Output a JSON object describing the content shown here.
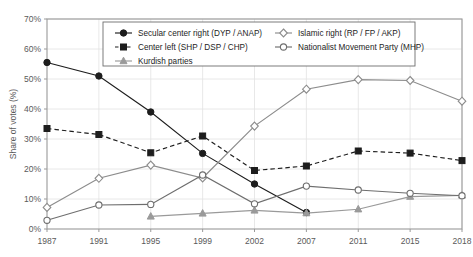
{
  "chart_data": {
    "type": "line",
    "title": "",
    "xlabel": "",
    "ylabel": "Share of votes (%)",
    "categories": [
      "1987",
      "1991",
      "1995",
      "1999",
      "2002",
      "2007",
      "2011",
      "2015",
      "2018"
    ],
    "ylim": [
      0,
      70
    ],
    "ytick_values": [
      0,
      10,
      20,
      30,
      40,
      50,
      60,
      70
    ],
    "ytick_labels": [
      "0%",
      "10%",
      "20%",
      "30%",
      "40%",
      "50%",
      "60%",
      "70%"
    ],
    "grid": true,
    "legend_position": "top-inside",
    "series": [
      {
        "name": "Secular center right (DYP / ANAP)",
        "marker": "filled-circle",
        "linestyle": "solid",
        "color": "#1d1d1d",
        "values": [
          55.5,
          51.0,
          39.0,
          25.2,
          15.0,
          5.5,
          null,
          null,
          null
        ]
      },
      {
        "name": "Center left (SHP / DSP / CHP)",
        "marker": "filled-square",
        "linestyle": "dashed",
        "color": "#1d1d1d",
        "values": [
          33.5,
          31.5,
          25.4,
          31.0,
          19.5,
          21.0,
          26.0,
          25.3,
          22.8
        ]
      },
      {
        "name": "Kurdish parties",
        "marker": "filled-triangle",
        "linestyle": "solid",
        "color": "#9a9a9a",
        "values": [
          null,
          null,
          4.2,
          5.2,
          6.2,
          5.3,
          6.6,
          10.8,
          11.2
        ]
      },
      {
        "name": "Islamic right (RP / FP / AKP)",
        "marker": "open-diamond",
        "linestyle": "solid",
        "color": "#8c8c8c",
        "values": [
          7.2,
          16.9,
          21.3,
          17.0,
          34.3,
          46.6,
          49.8,
          49.5,
          42.6
        ]
      },
      {
        "name": "Nationalist Movement Party (MHP)",
        "marker": "open-circle",
        "linestyle": "solid",
        "color": "#6e6e6e",
        "values": [
          2.9,
          8.0,
          8.2,
          18.0,
          8.4,
          14.3,
          13.0,
          11.9,
          11.1
        ]
      }
    ]
  },
  "legend": {
    "entries": [
      {
        "label": "Secular center right (DYP / ANAP)"
      },
      {
        "label": "Islamic right (RP / FP / AKP)"
      },
      {
        "label": "Center left (SHP / DSP / CHP)"
      },
      {
        "label": "Nationalist Movement Party (MHP)"
      },
      {
        "label": "Kurdish parties"
      }
    ]
  },
  "colors": {
    "axis": "#9a9a9a",
    "grid": "#e2e2e2",
    "text": "#5a5a5a",
    "dark_series": "#1d1d1d",
    "light_series": "#9a9a9a",
    "background": "#ffffff"
  }
}
